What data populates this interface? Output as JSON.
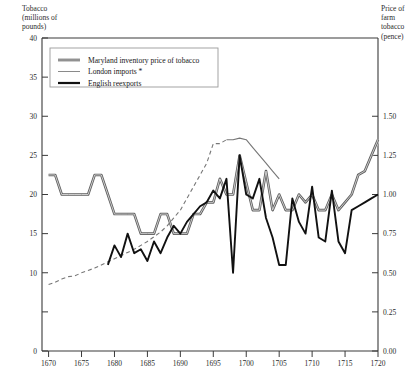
{
  "chart_data": {
    "type": "line",
    "title": "",
    "ylabel_left": "Tobacco\n(millions of\npounds)",
    "ylabel_right": "Price of\nfarm\ntobacco\n(pence)",
    "xlabel": "",
    "xlim": [
      1669,
      1720
    ],
    "ylim_left": [
      0,
      40
    ],
    "ylim_right": [
      0.0,
      2.0
    ],
    "grid": false,
    "legend_position": "top-left-inset",
    "left_axis": {
      "ticks": [
        0,
        5,
        10,
        15,
        20,
        25,
        30,
        35,
        40
      ],
      "tick_labels": [
        "0",
        "",
        "10",
        "15",
        "20",
        "25",
        "30",
        "35",
        "40"
      ]
    },
    "right_axis": {
      "ticks": [
        0.0,
        0.25,
        0.5,
        0.75,
        1.0,
        1.25,
        1.5
      ],
      "tick_labels": [
        "0.00",
        "0.25",
        "0.50",
        "0.75",
        "1.00",
        "1.25",
        "1.50"
      ],
      "note": "right scale maps 0.00 pence to left-value 0 and 1.50 pence to left-value 30"
    },
    "x_ticks": [
      1670,
      1675,
      1680,
      1685,
      1690,
      1695,
      1700,
      1705,
      1710,
      1715,
      1720
    ],
    "x_tick_labels": [
      "1670",
      "1675",
      "1680",
      "1685",
      "1690",
      "1695",
      "1700",
      "1705",
      "1710",
      "1715",
      "1720"
    ],
    "series": [
      {
        "name": "Maryland inventory price of tobacco",
        "axis": "right",
        "style": "thick-gray",
        "color": "#555555",
        "x": [
          1670,
          1671,
          1672,
          1673,
          1674,
          1675,
          1676,
          1677,
          1678,
          1679,
          1680,
          1681,
          1682,
          1683,
          1684,
          1685,
          1686,
          1687,
          1688,
          1689,
          1690,
          1691,
          1692,
          1693,
          1694,
          1695,
          1696,
          1697,
          1698,
          1699,
          1700,
          1701,
          1702,
          1703,
          1704,
          1705,
          1706,
          1707,
          1708,
          1709,
          1710,
          1711,
          1712,
          1713,
          1714,
          1715,
          1716,
          1717,
          1718,
          1719,
          1720
        ],
        "values_pence": [
          1.125,
          1.125,
          1.0,
          1.0,
          1.0,
          1.0,
          1.0,
          1.125,
          1.125,
          1.0,
          0.875,
          0.875,
          0.875,
          0.875,
          0.75,
          0.75,
          0.75,
          0.875,
          0.875,
          0.75,
          0.75,
          0.75,
          0.875,
          0.875,
          0.95,
          0.95,
          1.1,
          1.0,
          1.0,
          1.25,
          1.075,
          0.9,
          0.9,
          1.15,
          0.9,
          1.0,
          0.9,
          0.9,
          1.0,
          0.95,
          1.0,
          0.9,
          0.9,
          1.0,
          0.9,
          0.95,
          1.0,
          1.125,
          1.15,
          1.25,
          1.35
        ],
        "values_left_equivalent": [
          22.5,
          22.5,
          20,
          20,
          20,
          20,
          20,
          22.5,
          22.5,
          20,
          17.5,
          17.5,
          17.5,
          17.5,
          15,
          15,
          15,
          17.5,
          17.5,
          15,
          15,
          15,
          17.5,
          17.5,
          19,
          19,
          22,
          20,
          20,
          25,
          21.5,
          18,
          18,
          23,
          18,
          20,
          18,
          18,
          20,
          19,
          20,
          18,
          18,
          20,
          18,
          19,
          20,
          22.5,
          23,
          25,
          27
        ]
      },
      {
        "name": "London imports *",
        "axis": "left",
        "style": "thin-dashed-then-solid",
        "color": "#777777",
        "dashed_until": 1697,
        "x": [
          1670,
          1671,
          1672,
          1673,
          1674,
          1675,
          1676,
          1677,
          1678,
          1679,
          1680,
          1681,
          1682,
          1683,
          1684,
          1685,
          1686,
          1687,
          1688,
          1689,
          1690,
          1691,
          1692,
          1693,
          1694,
          1695,
          1696,
          1697,
          1698,
          1699,
          1700,
          1701,
          1702,
          1703,
          1704,
          1705
        ],
        "values": [
          8.5,
          8.8,
          9.2,
          9.5,
          9.6,
          10.0,
          10.3,
          10.6,
          11.0,
          11.4,
          11.8,
          12.2,
          12.6,
          13.0,
          13.5,
          14.0,
          14.6,
          15.2,
          16.0,
          17.0,
          18.0,
          19.5,
          21.0,
          22.5,
          24.0,
          26.5,
          26.5,
          27.0,
          27.0,
          27.2,
          27.0,
          26.0,
          25.0,
          24.0,
          23.0,
          22.0
        ]
      },
      {
        "name": "English reexports",
        "axis": "left",
        "style": "thick-black",
        "color": "#111111",
        "x": [
          1679,
          1680,
          1681,
          1682,
          1683,
          1684,
          1685,
          1686,
          1687,
          1688,
          1689,
          1690,
          1691,
          1692,
          1693,
          1694,
          1695,
          1696,
          1697,
          1698,
          1699,
          1700,
          1701,
          1702,
          1703,
          1704,
          1705,
          1706,
          1707,
          1708,
          1709,
          1710,
          1711,
          1712,
          1713,
          1714,
          1715,
          1716,
          1717,
          1718,
          1719,
          1720
        ],
        "values": [
          11.0,
          13.5,
          12.0,
          15.0,
          12.5,
          13.0,
          11.5,
          14.0,
          12.5,
          14.5,
          16.0,
          15.0,
          16.5,
          17.5,
          18.5,
          19.0,
          20.5,
          19.5,
          22.0,
          10.0,
          25.0,
          20.0,
          19.5,
          22.0,
          17.0,
          14.5,
          11.0,
          11.0,
          19.5,
          16.5,
          15.0,
          21.0,
          14.5,
          14.0,
          20.5,
          14.0,
          12.5,
          18.0,
          18.5,
          19.0,
          19.5,
          20.0
        ]
      }
    ],
    "legend": [
      {
        "label": "Maryland inventory price of tobacco",
        "swatch": "thick-gray",
        "color": "#555555"
      },
      {
        "label": "London imports *",
        "swatch": "thin-gray",
        "color": "#8a8a8a"
      },
      {
        "label": "English reexports",
        "swatch": "thick-black",
        "color": "#111111"
      }
    ]
  }
}
